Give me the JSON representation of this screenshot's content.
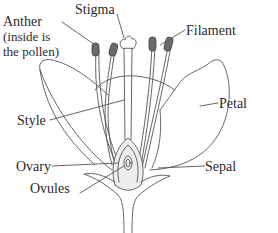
{
  "diagram": {
    "labels": {
      "anther": "Anther",
      "anther_note_1": "(inside is",
      "anther_note_2": "the pollen)",
      "stigma": "Stigma",
      "filament": "Filament",
      "style": "Style",
      "petal": "Petal",
      "ovary": "Ovary",
      "sepal": "Sepal",
      "ovules": "Ovules"
    },
    "colors": {
      "line": "#555555",
      "anther_fill": "#6a6a6a",
      "ovary_fill": "#eeeeee",
      "text": "#2a2a2a"
    }
  }
}
